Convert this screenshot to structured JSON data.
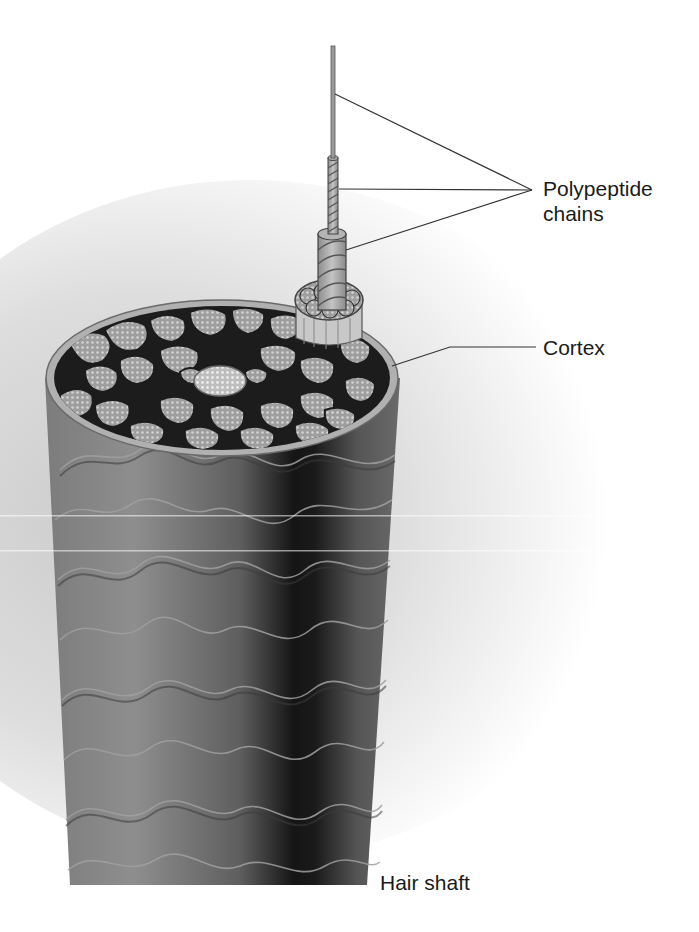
{
  "figure": {
    "labels": {
      "polypeptide_line1": "Polypeptide",
      "polypeptide_line2": "chains",
      "cortex": "Cortex",
      "hair_shaft": "Hair shaft"
    },
    "colors": {
      "background": "#ffffff",
      "halo": "#c8c8c8",
      "shaft_light": "#8a8a8a",
      "shaft_mid": "#6e6e6e",
      "shaft_dark": "#1e1e1e",
      "cortex_matrix": "#1c1c1c",
      "fibril_fill": "#a8a8a8",
      "fibril_dot": "#d6d6d6",
      "rim": "#b4b4b4",
      "leader_line": "#333333",
      "label_text": "#1a1a1a"
    }
  }
}
